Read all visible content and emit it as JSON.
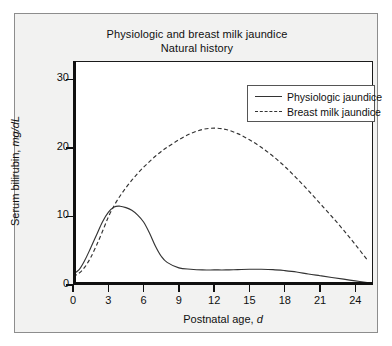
{
  "figure": {
    "title_line1": "Physiologic and breast milk jaundice",
    "title_line2": "Natural history",
    "background_color": "#f2f2f1",
    "plot_background_color": "#ffffff",
    "axis_color": "#101010",
    "curve_color": "#333333"
  },
  "legend": {
    "position": "top-right-inside",
    "entries": [
      {
        "label": "Physiologic jaundice",
        "style": "solid",
        "icon": "solid-line-icon"
      },
      {
        "label": "Breast milk jaundice",
        "style": "dashed",
        "icon": "dashed-line-icon"
      }
    ]
  },
  "axes": {
    "x": {
      "label_text": "Postnatal age, ",
      "label_italic": "d",
      "ticks": [
        "0",
        "3",
        "6",
        "9",
        "12",
        "15",
        "18",
        "21",
        "24"
      ],
      "tick_values": [
        0,
        3,
        6,
        9,
        12,
        15,
        18,
        21,
        24
      ],
      "min": 0,
      "max": 25.5
    },
    "y": {
      "label_text": "Serum bilirubin, ",
      "label_italic": "mg/dL",
      "ticks": [
        "0",
        "10",
        "20",
        "30"
      ],
      "tick_values": [
        0,
        10,
        20,
        30
      ],
      "min": 0,
      "max": 32.7
    }
  },
  "chart_data": {
    "type": "line",
    "xlabel": "Postnatal age, d",
    "ylabel": "Serum bilirubin, mg/dL",
    "xlim": [
      0,
      25.5
    ],
    "ylim": [
      0,
      32.7
    ],
    "grid": false,
    "legend_position": "upper right",
    "x": [
      0,
      0.5,
      1,
      1.5,
      2,
      2.5,
      3,
      3.5,
      4,
      4.5,
      5,
      5.5,
      6,
      6.5,
      7,
      7.5,
      8,
      9,
      10,
      11,
      12,
      13,
      14,
      15,
      16,
      17,
      18,
      19,
      20,
      21,
      22,
      23,
      24,
      25
    ],
    "series": [
      {
        "name": "Physiologic jaundice",
        "style": "solid",
        "values": [
          1.6,
          2.2,
          3.6,
          5.4,
          7.3,
          9.2,
          10.6,
          11.4,
          11.5,
          11.3,
          10.9,
          10.2,
          9.2,
          7.6,
          5.7,
          4.2,
          3.3,
          2.5,
          2.3,
          2.2,
          2.2,
          2.2,
          2.25,
          2.3,
          2.3,
          2.25,
          2.1,
          1.9,
          1.6,
          1.35,
          1.1,
          0.85,
          0.6,
          0.35
        ]
      },
      {
        "name": "Breast milk jaundice",
        "style": "dashed",
        "values": [
          1.3,
          1.7,
          2.6,
          4.0,
          5.8,
          7.8,
          9.9,
          11.6,
          13.0,
          14.2,
          15.3,
          16.3,
          17.2,
          18.0,
          18.8,
          19.5,
          20.1,
          21.2,
          22.1,
          22.7,
          22.9,
          22.7,
          22.1,
          21.2,
          20.1,
          18.8,
          17.3,
          15.6,
          13.8,
          11.9,
          10.0,
          8.0,
          5.9,
          3.7
        ]
      }
    ],
    "annotations": [
      {
        "text": "Physiologic peak ~11.5 mg/dL at day 4"
      },
      {
        "text": "Breast milk peak ~23 mg/dL at day 12"
      }
    ]
  }
}
